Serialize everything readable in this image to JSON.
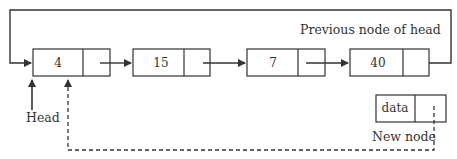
{
  "diagram": {
    "colors": {
      "line": "#333333",
      "box_fill": "#ffffff",
      "text": "#333333",
      "background": "#ffffff"
    },
    "nodes": [
      {
        "id": "n4",
        "value": "4"
      },
      {
        "id": "n15",
        "value": "15"
      },
      {
        "id": "n7",
        "value": "7"
      },
      {
        "id": "n40",
        "value": "40"
      }
    ],
    "new_node": {
      "value": "data",
      "label": "New node"
    },
    "labels": {
      "head": "Head",
      "previous_node": "Previous node of head"
    },
    "edges": [
      {
        "from": "n4",
        "to": "n15",
        "style": "solid"
      },
      {
        "from": "n15",
        "to": "n7",
        "style": "solid"
      },
      {
        "from": "n7",
        "to": "n40",
        "style": "solid"
      },
      {
        "from": "n40",
        "to": "n4",
        "style": "solid",
        "note": "loop back over top"
      },
      {
        "from": "new_node",
        "to": "n4",
        "style": "dashed"
      },
      {
        "from": "head",
        "to": "n4",
        "style": "solid"
      }
    ]
  }
}
